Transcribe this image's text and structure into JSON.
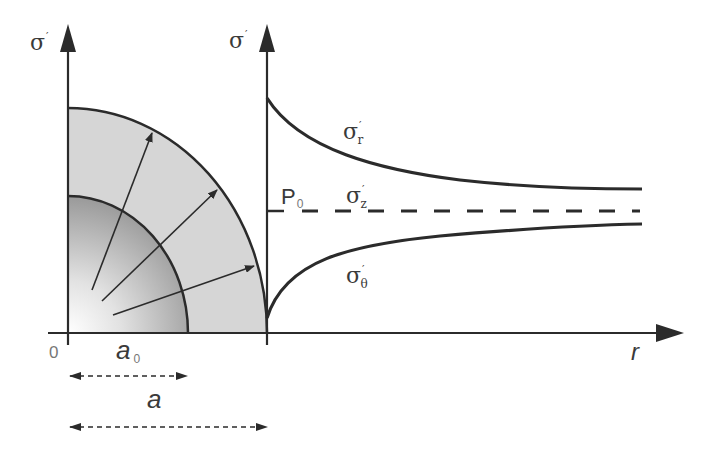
{
  "diagram": {
    "colors": {
      "line": "#2b2b2b",
      "outer_ring_fill": "#d4d4d4",
      "inner_core_dark": "#8a8a8a",
      "inner_core_light": "#ffffff",
      "label": "#3a3a3a"
    },
    "left_axis": {
      "label": "σ",
      "prime": "′"
    },
    "right_axis": {
      "label": "σ",
      "prime": "′"
    },
    "r_axis": {
      "label": "r"
    },
    "origin_label": "0",
    "radius_labels": {
      "a0": {
        "base": "a",
        "sub": "0"
      },
      "a": {
        "base": "a"
      }
    },
    "curves": {
      "sigma_r": {
        "base": "σ",
        "sub": "r",
        "prime": "′"
      },
      "sigma_z": {
        "base": "σ",
        "sub": "z",
        "prime": "′"
      },
      "sigma_theta": {
        "base": "σ",
        "sub": "θ",
        "prime": "′"
      }
    },
    "p0": {
      "base": "P",
      "sub": "0"
    }
  }
}
